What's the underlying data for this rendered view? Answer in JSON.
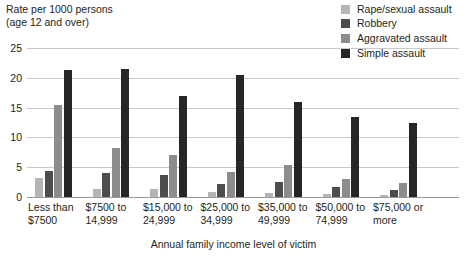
{
  "axis": {
    "y_title": "Rate per 1000 persons\n(age 12 and over)",
    "x_title": "Annual family income level of victim",
    "y_ticks": [
      "0",
      "5",
      "10",
      "15",
      "20",
      "25"
    ]
  },
  "legend": {
    "items": [
      {
        "label": "Rape/sexual assault",
        "color": "#b5b5b5",
        "swatch_name": "legend-swatch-rape-sexual-assault"
      },
      {
        "label": "Robbery",
        "color": "#4d4d4d",
        "swatch_name": "legend-swatch-robbery"
      },
      {
        "label": "Aggravated assault",
        "color": "#8c8c8c",
        "swatch_name": "legend-swatch-aggravated-assault"
      },
      {
        "label": "Simple assault",
        "color": "#262626",
        "swatch_name": "legend-swatch-simple-assault"
      }
    ]
  },
  "chart_data": {
    "type": "bar",
    "title": "",
    "xlabel": "Annual family income level of victim",
    "ylabel": "Rate per 1000 persons (age 12 and over)",
    "ylim": [
      0,
      25
    ],
    "yticks": [
      0,
      5,
      10,
      15,
      20,
      25
    ],
    "grid": true,
    "legend_position": "top-right",
    "categories": [
      "Less than\n$7500",
      "$7500 to\n14,999",
      "$15,000 to\n24,999",
      "$25,000 to\n34,999",
      "$35,000 to\n49,999",
      "$50,000 to\n74,999",
      "$75,000 or\nmore"
    ],
    "series": [
      {
        "name": "Rape/sexual assault",
        "color": "#b5b5b5",
        "values": [
          3.2,
          1.3,
          1.4,
          0.9,
          0.7,
          0.5,
          0.3
        ]
      },
      {
        "name": "Robbery",
        "color": "#4d4d4d",
        "values": [
          4.4,
          4.0,
          3.7,
          2.1,
          2.5,
          1.6,
          1.2
        ]
      },
      {
        "name": "Aggravated assault",
        "color": "#8c8c8c",
        "values": [
          15.5,
          8.3,
          7.1,
          4.2,
          5.3,
          3.1,
          2.4
        ]
      },
      {
        "name": "Simple assault",
        "color": "#262626",
        "values": [
          21.3,
          21.4,
          17.0,
          20.4,
          16.0,
          13.4,
          12.4
        ]
      }
    ]
  }
}
